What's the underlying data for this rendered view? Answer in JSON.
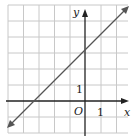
{
  "graph": {
    "equation": "y = x + 3",
    "x_axis_label": "x",
    "y_axis_label": "y",
    "origin_label": "O",
    "x_tick_label": "1",
    "y_tick_label": "1",
    "x_range": [
      -5,
      3
    ],
    "y_range": [
      -2,
      6
    ],
    "line_points": [
      [
        -5,
        -2
      ],
      [
        3,
        6
      ]
    ],
    "x_intercept": -3,
    "y_intercept": 3,
    "grid_color": "#c8c8c8",
    "line_color": "#555555"
  }
}
